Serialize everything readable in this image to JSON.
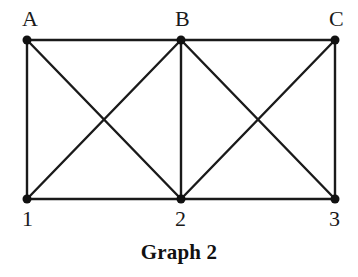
{
  "figure": {
    "caption": "Graph 2",
    "background_color": "#ffffff",
    "stroke_color": "#1a1a1a",
    "node_fill_color": "#111111",
    "label_color": "#1a1a1a"
  },
  "chart_data": {
    "type": "diagram",
    "title": "Graph 2",
    "subtitle": "",
    "xlabel": "",
    "ylabel": "",
    "grid": false,
    "legend": "none",
    "nodes": [
      {
        "id": "A",
        "label": "A",
        "x": 27,
        "y": 40,
        "row": "top",
        "label_x": 22,
        "label_y": 8
      },
      {
        "id": "B",
        "label": "B",
        "x": 181,
        "y": 40,
        "row": "top",
        "label_x": 175,
        "label_y": 8
      },
      {
        "id": "C",
        "label": "C",
        "x": 335,
        "y": 40,
        "row": "top",
        "label_x": 329,
        "label_y": 8
      },
      {
        "id": "1",
        "label": "1",
        "x": 27,
        "y": 199,
        "row": "bottom",
        "label_x": 22,
        "label_y": 208
      },
      {
        "id": "2",
        "label": "2",
        "x": 181,
        "y": 199,
        "row": "bottom",
        "label_x": 175,
        "label_y": 208
      },
      {
        "id": "3",
        "label": "3",
        "x": 335,
        "y": 199,
        "row": "bottom",
        "label_x": 329,
        "label_y": 208
      }
    ],
    "edges": [
      {
        "from": "A",
        "to": "B",
        "kind": "top-horizontal"
      },
      {
        "from": "B",
        "to": "C",
        "kind": "top-horizontal"
      },
      {
        "from": "1",
        "to": "2",
        "kind": "bottom-horizontal"
      },
      {
        "from": "2",
        "to": "3",
        "kind": "bottom-horizontal"
      },
      {
        "from": "A",
        "to": "1",
        "kind": "vertical"
      },
      {
        "from": "B",
        "to": "2",
        "kind": "vertical"
      },
      {
        "from": "C",
        "to": "3",
        "kind": "vertical"
      },
      {
        "from": "A",
        "to": "2",
        "kind": "diagonal"
      },
      {
        "from": "B",
        "to": "1",
        "kind": "diagonal"
      },
      {
        "from": "B",
        "to": "3",
        "kind": "diagonal"
      },
      {
        "from": "C",
        "to": "2",
        "kind": "diagonal"
      }
    ],
    "edge_count": 11,
    "node_count": 6,
    "node_radius": 4.5,
    "edge_width": 2.4,
    "crossings": [
      {
        "x": 104,
        "y": 120
      },
      {
        "x": 258,
        "y": 120
      }
    ]
  }
}
